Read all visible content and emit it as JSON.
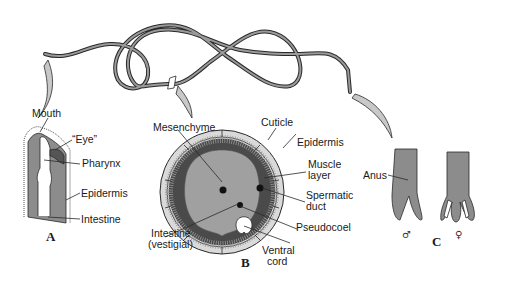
{
  "figure": {
    "panels": {
      "A": {
        "letter": "A",
        "labels": {
          "mouth": "Mouth",
          "eye": "“Eye”",
          "pharynx": "Pharynx",
          "epidermis": "Epidermis",
          "intestine": "Intestine"
        }
      },
      "B": {
        "letter": "B",
        "labels": {
          "mesenchyme": "Mesenchyme",
          "cuticle": "Cuticle",
          "epidermis": "Epidermis",
          "muscle_layer_1": "Muscle",
          "muscle_layer_2": "layer",
          "spermatic_duct_1": "Spermatic",
          "spermatic_duct_2": "duct",
          "pseudocoel": "Pseudocoel",
          "ventral_cord_1": "Ventral",
          "ventral_cord_2": "cord",
          "intestine_1": "Intestine",
          "intestine_2": "(vestigial)"
        }
      },
      "C": {
        "letter": "C",
        "labels": {
          "anus": "Anus",
          "male_symbol": "♂",
          "female_symbol": "♀"
        }
      }
    },
    "colors": {
      "tissue_gray": "#8c8c8c",
      "dark_gray": "#5a5a5a",
      "light_gray": "#d4d4d4",
      "outline": "#2a2a2a",
      "background": "#ffffff"
    }
  }
}
